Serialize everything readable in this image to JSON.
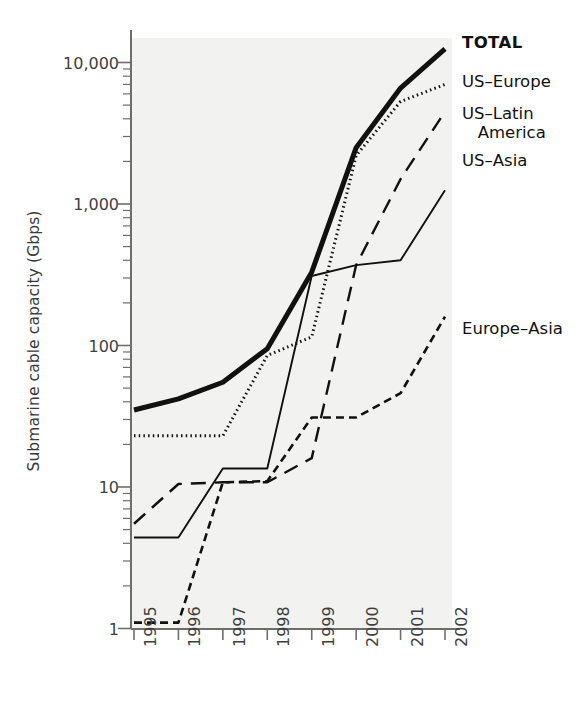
{
  "chart_data": {
    "type": "line",
    "title": "",
    "xlabel": "",
    "ylabel": "Submarine cable capacity (Gbps)",
    "yscale": "log",
    "ylim": [
      1,
      20000
    ],
    "grid": false,
    "legend_position": "right-inline",
    "categories": [
      "1995",
      "1996",
      "1997",
      "1998",
      "1999",
      "2000",
      "2001",
      "2002"
    ],
    "ytick_labels": [
      "1",
      "10",
      "100",
      "1,000",
      "10,000"
    ],
    "ytick_values": [
      1,
      10,
      100,
      1000,
      10000
    ],
    "series": [
      {
        "name": "TOTAL",
        "style": "solid-thick",
        "values": [
          35,
          42,
          55,
          95,
          330,
          2500,
          6600,
          12500
        ]
      },
      {
        "name": "US–Europe",
        "style": "dotted",
        "values": [
          23,
          23,
          23,
          85,
          115,
          2200,
          5300,
          7000
        ]
      },
      {
        "name": "US–Latin\n   America",
        "style": "long-dash",
        "values": [
          5.5,
          10.5,
          10.8,
          10.8,
          16,
          370,
          1500,
          4500
        ]
      },
      {
        "name": "US–Asia",
        "style": "solid-thin",
        "values": [
          4.4,
          4.4,
          13.5,
          13.5,
          310,
          370,
          400,
          1250
        ]
      },
      {
        "name": "Europe–Asia",
        "style": "short-dash",
        "values": [
          1.1,
          1.1,
          10.8,
          11.0,
          31,
          31,
          46,
          160
        ]
      }
    ],
    "labels": [
      {
        "name": "TOTAL",
        "text": "TOTAL",
        "bold": true
      },
      {
        "name": "US–Europe",
        "text": "US–Europe",
        "bold": false
      },
      {
        "name": "US–Latin America",
        "text": "US–Latin\n   America",
        "bold": false
      },
      {
        "name": "US–Asia",
        "text": "US–Asia",
        "bold": false
      },
      {
        "name": "Europe–Asia",
        "text": "Europe–Asia",
        "bold": false
      }
    ]
  },
  "colors": {
    "plot_background": "#f2f2f0",
    "axis": "#6e6e6e",
    "ink": "#111111",
    "tick_text": "#3f3f3f"
  }
}
